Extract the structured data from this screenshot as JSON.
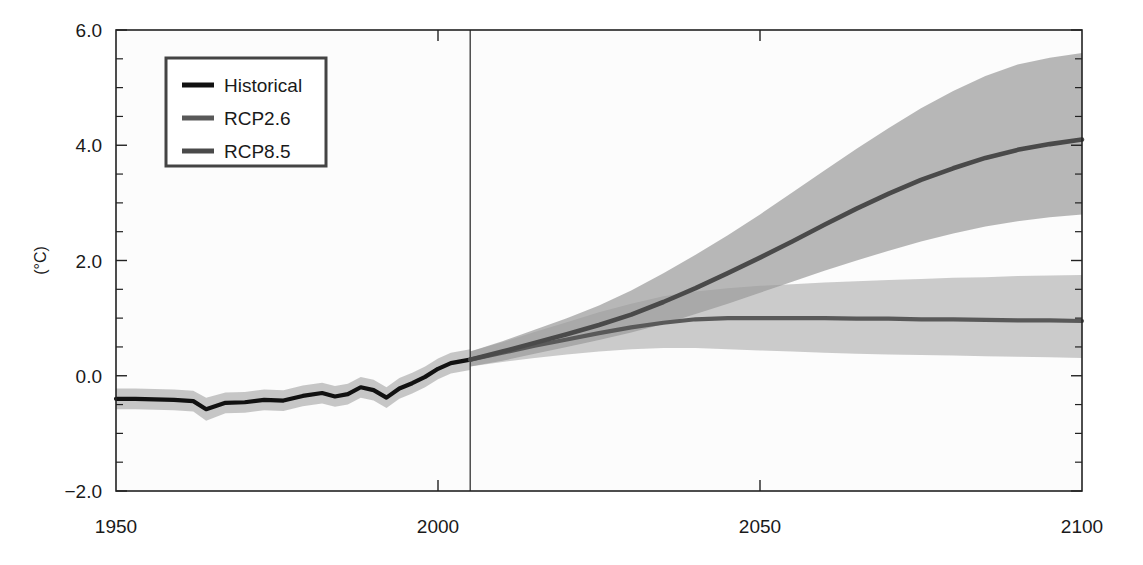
{
  "chart_data": {
    "type": "line",
    "title": "",
    "xlabel": "",
    "ylabel": "(°C)",
    "xlim": [
      1950,
      2100
    ],
    "ylim": [
      -2.0,
      6.0
    ],
    "grid": false,
    "legend_position": "top-left",
    "x_ticks": [
      1950,
      2000,
      2050,
      2100
    ],
    "x_tick_labels": [
      "1950",
      "2000",
      "2050",
      "2100"
    ],
    "y_ticks": [
      -2.0,
      0.0,
      2.0,
      4.0,
      6.0
    ],
    "y_tick_labels": [
      "-2.0",
      "0.0",
      "2.0",
      "4.0",
      "6.0"
    ],
    "y_minor_ticks": [
      -1.5,
      -1.0,
      -0.5,
      0.5,
      1.0,
      1.5,
      2.5,
      3.0,
      3.5,
      4.5,
      5.0,
      5.5
    ],
    "annotations": [
      {
        "name": "historical-projection-divider",
        "type": "vline",
        "x": 2005
      }
    ],
    "series": [
      {
        "name": "Historical",
        "color": "#111111",
        "line_width": 4.2,
        "x": [
          1950,
          1953,
          1956,
          1959,
          1962,
          1964,
          1967,
          1970,
          1973,
          1976,
          1979,
          1982,
          1984,
          1986,
          1988,
          1990,
          1992,
          1994,
          1996,
          1998,
          2000,
          2002,
          2005
        ],
        "values": [
          -0.4,
          -0.4,
          -0.41,
          -0.42,
          -0.44,
          -0.58,
          -0.47,
          -0.46,
          -0.42,
          -0.43,
          -0.35,
          -0.3,
          -0.36,
          -0.32,
          -0.2,
          -0.25,
          -0.38,
          -0.22,
          -0.13,
          -0.02,
          0.12,
          0.22,
          0.28
        ],
        "band_lower": [
          -0.58,
          -0.58,
          -0.59,
          -0.6,
          -0.62,
          -0.78,
          -0.65,
          -0.64,
          -0.6,
          -0.61,
          -0.53,
          -0.48,
          -0.54,
          -0.5,
          -0.38,
          -0.43,
          -0.56,
          -0.4,
          -0.31,
          -0.2,
          -0.06,
          0.04,
          0.1
        ],
        "band_upper": [
          -0.22,
          -0.22,
          -0.23,
          -0.24,
          -0.26,
          -0.38,
          -0.29,
          -0.28,
          -0.24,
          -0.25,
          -0.17,
          -0.12,
          -0.18,
          -0.14,
          -0.02,
          -0.07,
          -0.2,
          -0.04,
          0.05,
          0.16,
          0.3,
          0.4,
          0.46
        ],
        "band_color": "#b4b4b4",
        "band_opacity": 0.75
      },
      {
        "name": "RCP2.6",
        "color": "#595959",
        "line_width": 4.2,
        "x": [
          2005,
          2010,
          2015,
          2020,
          2025,
          2030,
          2035,
          2040,
          2045,
          2050,
          2055,
          2060,
          2065,
          2070,
          2075,
          2080,
          2085,
          2090,
          2095,
          2100
        ],
        "values": [
          0.28,
          0.4,
          0.52,
          0.63,
          0.74,
          0.84,
          0.92,
          0.98,
          1.0,
          1.0,
          1.0,
          1.0,
          0.99,
          0.99,
          0.98,
          0.98,
          0.97,
          0.96,
          0.96,
          0.95
        ],
        "band_lower": [
          0.16,
          0.24,
          0.31,
          0.37,
          0.42,
          0.46,
          0.48,
          0.48,
          0.46,
          0.44,
          0.42,
          0.4,
          0.38,
          0.37,
          0.36,
          0.35,
          0.34,
          0.33,
          0.32,
          0.31
        ],
        "band_upper": [
          0.42,
          0.58,
          0.76,
          0.93,
          1.1,
          1.25,
          1.38,
          1.46,
          1.52,
          1.56,
          1.59,
          1.62,
          1.64,
          1.66,
          1.68,
          1.7,
          1.71,
          1.73,
          1.74,
          1.75
        ],
        "band_color": "#adadad",
        "band_opacity": 0.62
      },
      {
        "name": "RCP8.5",
        "color": "#4a4a4a",
        "line_width": 4.6,
        "x": [
          2005,
          2010,
          2015,
          2020,
          2025,
          2030,
          2035,
          2040,
          2045,
          2050,
          2055,
          2060,
          2065,
          2070,
          2075,
          2080,
          2085,
          2090,
          2095,
          2100
        ],
        "values": [
          0.28,
          0.42,
          0.57,
          0.72,
          0.88,
          1.06,
          1.28,
          1.52,
          1.78,
          2.05,
          2.33,
          2.62,
          2.9,
          3.16,
          3.4,
          3.6,
          3.78,
          3.92,
          4.02,
          4.1
        ],
        "band_lower": [
          0.16,
          0.26,
          0.38,
          0.5,
          0.62,
          0.75,
          0.9,
          1.07,
          1.25,
          1.44,
          1.63,
          1.82,
          2.0,
          2.17,
          2.33,
          2.47,
          2.59,
          2.68,
          2.75,
          2.8
        ],
        "band_upper": [
          0.42,
          0.6,
          0.8,
          1.0,
          1.22,
          1.48,
          1.78,
          2.1,
          2.44,
          2.8,
          3.18,
          3.56,
          3.94,
          4.3,
          4.64,
          4.94,
          5.2,
          5.4,
          5.52,
          5.6
        ],
        "band_color": "#9a9a9a",
        "band_opacity": 0.7
      }
    ]
  },
  "legend": {
    "entries": [
      {
        "label": "Historical",
        "color": "#111111"
      },
      {
        "label": "RCP2.6",
        "color": "#595959"
      },
      {
        "label": "RCP8.5",
        "color": "#4a4a4a"
      }
    ]
  }
}
